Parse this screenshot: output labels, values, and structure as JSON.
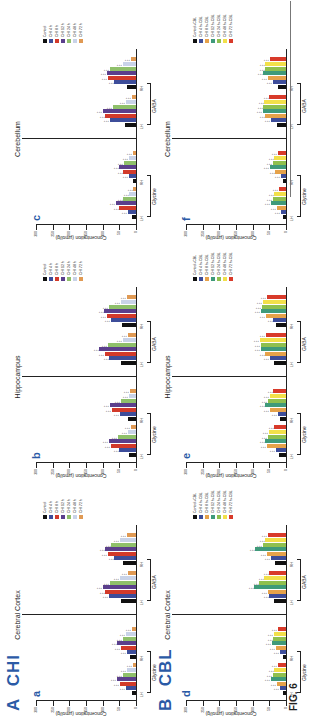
{
  "figure": {
    "title": "FIG. 6",
    "rows": [
      {
        "label": "A",
        "name": "CHI"
      },
      {
        "label": "B",
        "name": "CBL"
      }
    ]
  },
  "chart_data": [
    {
      "type": "bar",
      "panel": "a",
      "row": "CHI",
      "title": "Cerebral Cortex",
      "ylabel": "Concentration (µmol/g)",
      "yticks": [
        0,
        50,
        100,
        150,
        200,
        250,
        300
      ],
      "ylim": [
        0,
        300
      ],
      "groups": [
        {
          "amino_acid": "Glycine",
          "subs": [
            "LH",
            "RH"
          ]
        },
        {
          "amino_acid": "GABA",
          "subs": [
            "LH",
            "RH"
          ]
        }
      ],
      "legend": [
        "Control",
        "CHI 4 h",
        "CHI 8 h",
        "CHI 12 h",
        "CHI 24 h",
        "CHI 48 h",
        "CHI 72 h"
      ],
      "colors": [
        "#111111",
        "#3d4d9a",
        "#d23a2a",
        "#5b3f8c",
        "#8fc06a",
        "#c9d3e8",
        "#e09a54"
      ],
      "series": [
        {
          "name": "Glycine LH",
          "values": [
            12,
            30,
            48,
            57,
            40,
            28,
            10
          ]
        },
        {
          "name": "Glycine RH",
          "values": [
            18,
            28,
            45,
            56,
            40,
            30,
            12
          ]
        },
        {
          "name": "GABA LH",
          "values": [
            45,
            82,
            92,
            100,
            78,
            48,
            25
          ]
        },
        {
          "name": "GABA RH",
          "values": [
            40,
            65,
            85,
            92,
            74,
            48,
            28
          ]
        }
      ]
    },
    {
      "type": "bar",
      "panel": "b",
      "row": "CHI",
      "title": "Hippocampus",
      "ylabel": "Concentration (µmol/g)",
      "yticks": [
        0,
        50,
        100,
        150,
        200,
        250,
        300
      ],
      "ylim": [
        0,
        300
      ],
      "groups": [
        {
          "amino_acid": "Glycine",
          "subs": [
            "LH",
            "RH"
          ]
        },
        {
          "amino_acid": "GABA",
          "subs": [
            "LH",
            "RH"
          ]
        }
      ],
      "legend": [
        "Control",
        "CHI 4 h",
        "CHI 8 h",
        "CHI 12 h",
        "CHI 24 h",
        "CHI 48 h",
        "CHI 72 h"
      ],
      "colors": [
        "#111111",
        "#3d4d9a",
        "#d23a2a",
        "#5b3f8c",
        "#8fc06a",
        "#c9d3e8",
        "#e09a54"
      ],
      "series": [
        {
          "name": "Glycine LH",
          "values": [
            22,
            50,
            75,
            82,
            55,
            25,
            15
          ]
        },
        {
          "name": "Glycine RH",
          "values": [
            25,
            48,
            72,
            78,
            45,
            22,
            18
          ]
        },
        {
          "name": "GABA LH",
          "values": [
            45,
            80,
            94,
            110,
            85,
            40,
            25
          ]
        },
        {
          "name": "GABA RH",
          "values": [
            42,
            75,
            88,
            95,
            82,
            45,
            28
          ]
        }
      ]
    },
    {
      "type": "bar",
      "panel": "c",
      "row": "CHI",
      "title": "Cerebellum",
      "ylabel": "Concentration (µmol/g)",
      "yticks": [
        0,
        50,
        100,
        150,
        200,
        250,
        300
      ],
      "ylim": [
        0,
        300
      ],
      "groups": [
        {
          "amino_acid": "Glycine",
          "subs": [
            "LH",
            "RH"
          ]
        },
        {
          "amino_acid": "GABA",
          "subs": [
            "LH",
            "RH"
          ]
        }
      ],
      "legend": [
        "Control",
        "CHI 4 h",
        "CHI 8 h",
        "CHI 12 h",
        "CHI 24 h",
        "CHI 48 h",
        "CHI 72 h"
      ],
      "colors": [
        "#111111",
        "#3d4d9a",
        "#d23a2a",
        "#5b3f8c",
        "#8fc06a",
        "#c9d3e8",
        "#e09a54"
      ],
      "series": [
        {
          "name": "Glycine LH",
          "values": [
            12,
            25,
            50,
            60,
            38,
            20,
            8
          ]
        },
        {
          "name": "Glycine RH",
          "values": [
            10,
            22,
            38,
            50,
            36,
            22,
            10
          ]
        },
        {
          "name": "GABA LH",
          "values": [
            32,
            78,
            92,
            100,
            70,
            30,
            12
          ]
        },
        {
          "name": "GABA RH",
          "values": [
            28,
            65,
            85,
            88,
            78,
            40,
            15
          ]
        }
      ]
    },
    {
      "type": "bar",
      "panel": "d",
      "row": "CBL",
      "title": "Cerebral Cortex",
      "ylabel": "Concentration (µmol/g)",
      "yticks": [
        0,
        50,
        100,
        150,
        200,
        250,
        300
      ],
      "ylim": [
        0,
        300
      ],
      "groups": [
        {
          "amino_acid": "Glycine",
          "subs": [
            "LH",
            "RH"
          ]
        },
        {
          "amino_acid": "GABA",
          "subs": [
            "LH",
            "RH"
          ]
        }
      ],
      "legend": [
        "Control+CBL",
        "CHI 4 h+CBL",
        "CHI 8 h+CBL",
        "CHI 12 h+CBL",
        "CHI 24 h+CBL",
        "CHI 48 h+CBL",
        "CHI 72 h+CBL"
      ],
      "colors": [
        "#111111",
        "#3d4d9a",
        "#e6a24a",
        "#3f9a7a",
        "#8fc04e",
        "#f2e04a",
        "#d83a2a"
      ],
      "series": [
        {
          "name": "Glycine LH",
          "values": [
            10,
            18,
            28,
            45,
            40,
            35,
            25
          ]
        },
        {
          "name": "Glycine RH",
          "values": [
            10,
            18,
            30,
            42,
            38,
            36,
            25
          ]
        },
        {
          "name": "GABA LH",
          "values": [
            35,
            50,
            55,
            95,
            80,
            65,
            50
          ]
        },
        {
          "name": "GABA RH",
          "values": [
            32,
            45,
            58,
            92,
            70,
            62,
            55
          ]
        }
      ]
    },
    {
      "type": "bar",
      "panel": "e",
      "row": "CBL",
      "title": "Hippocampus",
      "ylabel": "Concentration (µmol/g)",
      "yticks": [
        0,
        50,
        100,
        150,
        200,
        250,
        300
      ],
      "ylim": [
        0,
        300
      ],
      "groups": [
        {
          "amino_acid": "Glycine",
          "subs": [
            "LH",
            "RH"
          ]
        },
        {
          "amino_acid": "GABA",
          "subs": [
            "LH",
            "RH"
          ]
        }
      ],
      "legend": [
        "Control+CBL",
        "CHI 4 h+CBL",
        "CHI 8 h+CBL",
        "CHI 12 h+CBL",
        "CHI 24 h+CBL",
        "CHI 48 h+CBL",
        "CHI 72 h+CBL"
      ],
      "colors": [
        "#111111",
        "#3d4d9a",
        "#e6a24a",
        "#3f9a7a",
        "#8fc04e",
        "#f2e04a",
        "#d83a2a"
      ],
      "series": [
        {
          "name": "Glycine LH",
          "values": [
            20,
            30,
            58,
            62,
            55,
            52,
            35
          ]
        },
        {
          "name": "Glycine RH",
          "values": [
            18,
            25,
            48,
            62,
            55,
            48,
            38
          ]
        },
        {
          "name": "GABA LH",
          "values": [
            35,
            48,
            62,
            75,
            75,
            78,
            60
          ]
        },
        {
          "name": "GABA RH",
          "values": [
            30,
            38,
            60,
            75,
            72,
            70,
            58
          ]
        }
      ]
    },
    {
      "type": "bar",
      "panel": "f",
      "row": "CBL",
      "title": "Cerebellum",
      "ylabel": "Concentration (µmol/g)",
      "yticks": [
        0,
        50,
        100,
        150,
        200,
        250,
        300
      ],
      "ylim": [
        0,
        300
      ],
      "groups": [
        {
          "amino_acid": "Glycine",
          "subs": [
            "LH",
            "RH"
          ]
        },
        {
          "amino_acid": "GABA",
          "subs": [
            "LH",
            "RH"
          ]
        }
      ],
      "legend": [
        "Control+CBL",
        "CHI 4 h+CBL",
        "CHI 8 h+CBL",
        "CHI 12 h+CBL",
        "CHI 24 h+CBL",
        "CHI 48 h+CBL",
        "CHI 72 h+CBL"
      ],
      "colors": [
        "#111111",
        "#3d4d9a",
        "#e6a24a",
        "#3f9a7a",
        "#8fc04e",
        "#f2e04a",
        "#d83a2a"
      ],
      "series": [
        {
          "name": "Glycine LH",
          "values": [
            8,
            15,
            28,
            45,
            40,
            35,
            22
          ]
        },
        {
          "name": "Glycine RH",
          "values": [
            8,
            15,
            32,
            48,
            40,
            35,
            25
          ]
        },
        {
          "name": "GABA LH",
          "values": [
            28,
            45,
            62,
            70,
            68,
            65,
            50
          ]
        },
        {
          "name": "GABA RH",
          "values": [
            25,
            40,
            55,
            68,
            62,
            62,
            48
          ]
        }
      ]
    }
  ],
  "panel_meta": [
    {
      "letter": "a",
      "title": "Cerebral Cortex"
    },
    {
      "letter": "b",
      "title": "Hippocampus"
    },
    {
      "letter": "c",
      "title": "Cerebellum"
    },
    {
      "letter": "d",
      "title": "Cerebral Cortex"
    },
    {
      "letter": "e",
      "title": "Hippocampus"
    },
    {
      "letter": "f",
      "title": "Cerebellum"
    }
  ],
  "axis": {
    "ylabel": "Concentration (µmol/g)",
    "yticks": [
      "0",
      "50",
      "100",
      "150",
      "200",
      "250",
      "300"
    ],
    "subs": [
      "LH",
      "RH"
    ],
    "amino_acids": [
      "Glycine",
      "GABA"
    ],
    "sig_marks": "* * *"
  }
}
